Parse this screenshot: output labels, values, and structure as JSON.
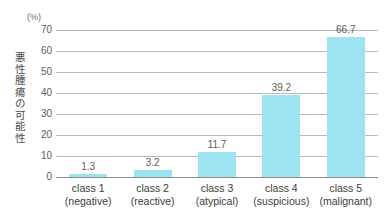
{
  "chart_data": {
    "type": "bar",
    "title": "",
    "subtitle": "",
    "xlabel": "",
    "ylabel": "悪性腫瘍の可能性",
    "unit_label": "(%)",
    "categories": [
      "class 1\n(negative)",
      "class 2\n(reactive)",
      "class 3\n(atypical)",
      "class 4\n(suspicious)",
      "class 5\n(malignant)"
    ],
    "category_lines": [
      {
        "line1": "class 1",
        "line2": "(negative)"
      },
      {
        "line1": "class 2",
        "line2": "(reactive)"
      },
      {
        "line1": "class 3",
        "line2": "(atypical)"
      },
      {
        "line1": "class 4",
        "line2": "(suspicious)"
      },
      {
        "line1": "class 5",
        "line2": "(malignant)"
      }
    ],
    "values": [
      1.3,
      3.2,
      11.7,
      39.2,
      66.7
    ],
    "value_labels": [
      "1.3",
      "3.2",
      "11.7",
      "39.2",
      "66.7"
    ],
    "ylim": [
      0,
      70
    ],
    "ytick_values": [
      0,
      10,
      20,
      30,
      40,
      50,
      60,
      70
    ],
    "ytick_labels": [
      "0",
      "10",
      "20",
      "30",
      "40",
      "50",
      "60",
      "70"
    ],
    "grid": true,
    "grid_axis": "y",
    "legend": false,
    "legend_position": "none",
    "bar_color": "#9ce4f1",
    "gridline_color": "#b9b9b9",
    "axis_color": "#8d8d8d",
    "text_color": "#3c3c3c",
    "background_color": "#ffffff"
  }
}
